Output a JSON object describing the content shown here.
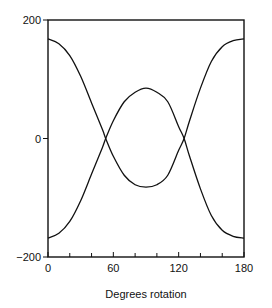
{
  "chart_data": {
    "type": "line",
    "title": "",
    "xlabel": "Degrees rotation",
    "ylabel": "",
    "xlim": [
      0,
      180
    ],
    "ylim": [
      -200,
      200
    ],
    "x_ticks": [
      0,
      60,
      120,
      180
    ],
    "x_minor_ticks": [
      20,
      40,
      80,
      100,
      140,
      160
    ],
    "y_ticks": [
      200,
      0,
      -200
    ],
    "y_tick_labels": [
      "200",
      "0",
      "−200"
    ],
    "x_tick_labels": [
      "0",
      "60",
      "120",
      "180"
    ],
    "grid": false,
    "series": [
      {
        "name": "curve-a",
        "x": [
          0,
          10,
          20,
          30,
          40,
          50,
          53,
          60,
          70,
          80,
          90,
          100,
          110,
          120,
          125,
          130,
          140,
          150,
          160,
          170,
          180
        ],
        "y": [
          168,
          160,
          140,
          105,
          60,
          15,
          0,
          -30,
          -62,
          -78,
          -82,
          -78,
          -62,
          -20,
          0,
          30,
          85,
          130,
          155,
          165,
          168
        ]
      },
      {
        "name": "curve-b",
        "x": [
          0,
          10,
          20,
          30,
          40,
          50,
          53,
          60,
          70,
          80,
          90,
          100,
          110,
          120,
          125,
          130,
          140,
          150,
          160,
          170,
          180
        ],
        "y": [
          -168,
          -160,
          -140,
          -105,
          -60,
          -15,
          0,
          30,
          62,
          78,
          85,
          78,
          62,
          20,
          0,
          -30,
          -85,
          -130,
          -155,
          -165,
          -168
        ]
      }
    ]
  }
}
